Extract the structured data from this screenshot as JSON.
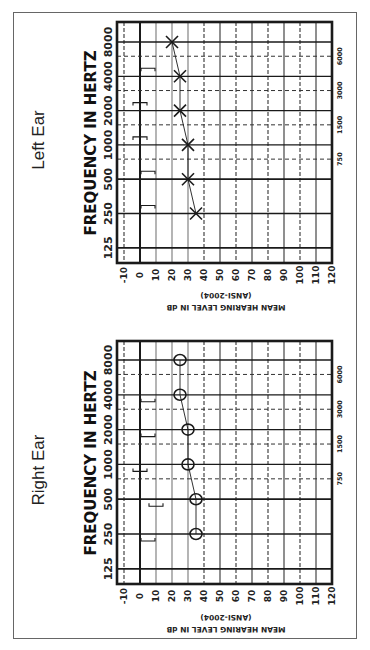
{
  "colors": {
    "ink": "#1a1a1a",
    "grid": "#333333",
    "grid_light": "#777777",
    "frame": "#666666"
  },
  "axis": {
    "frequency_title": "FREQUENCY IN HERTZ",
    "frequency_ticks": [
      "125",
      "250",
      "500",
      "1000",
      "2000",
      "4000",
      "8000"
    ],
    "interoctave_ticks": [
      "750",
      "1500",
      "3000",
      "6000"
    ],
    "db_ticks": [
      "-10",
      "0",
      "10",
      "20",
      "30",
      "40",
      "50",
      "60",
      "70",
      "80",
      "90",
      "100",
      "110",
      "120"
    ],
    "db_title": "MEAN HEARING LEVEL IN dB",
    "db_subtitle": "(ANSI-2004)"
  },
  "panels": [
    {
      "title": "Left Ear",
      "symbol": "X",
      "air_conduction_label": "Left ear air conduction (X)",
      "bone_conduction_shape": "bracket-open-down"
    },
    {
      "title": "Right Ear",
      "symbol": "O",
      "air_conduction_label": "Right ear air conduction (O)",
      "bone_conduction_shape": "bracket-open-up"
    }
  ],
  "chart_data": [
    {
      "type": "line",
      "title": "Left Ear",
      "xlabel": "FREQUENCY IN HERTZ",
      "ylabel": "MEAN HEARING LEVEL IN dB (ANSI-2004)",
      "x": [
        250,
        500,
        1000,
        2000,
        4000,
        8000
      ],
      "x_ticks": [
        125,
        250,
        500,
        1000,
        2000,
        4000,
        8000
      ],
      "x_minor_ticks": [
        750,
        1500,
        3000,
        6000
      ],
      "ylim": [
        -10,
        120
      ],
      "y_inverted": true,
      "grid": true,
      "orientation": "rotated-90",
      "series": [
        {
          "name": "Air conduction (X)",
          "marker": "x",
          "values": [
            35,
            30,
            30,
            25,
            25,
            20
          ]
        },
        {
          "name": "Bone conduction",
          "marker": "bracket",
          "points": [
            {
              "freq": 250,
              "db": 5
            },
            {
              "freq": 500,
              "db": 5
            },
            {
              "freq": 1000,
              "db": 0
            },
            {
              "freq": 2000,
              "db": 0
            },
            {
              "freq": 4000,
              "db": 5
            }
          ]
        }
      ]
    },
    {
      "type": "line",
      "title": "Right Ear",
      "xlabel": "FREQUENCY IN HERTZ",
      "ylabel": "MEAN HEARING LEVEL IN dB (ANSI-2004)",
      "x": [
        250,
        500,
        1000,
        2000,
        4000,
        8000
      ],
      "x_ticks": [
        125,
        250,
        500,
        1000,
        2000,
        4000,
        8000
      ],
      "x_minor_ticks": [
        750,
        1500,
        3000,
        6000
      ],
      "ylim": [
        -10,
        120
      ],
      "y_inverted": true,
      "grid": true,
      "orientation": "rotated-90",
      "series": [
        {
          "name": "Air conduction (O)",
          "marker": "o",
          "values": [
            35,
            35,
            30,
            30,
            25,
            25
          ]
        },
        {
          "name": "Bone conduction",
          "marker": "bracket",
          "points": [
            {
              "freq": 250,
              "db": 5
            },
            {
              "freq": 500,
              "db": 10
            },
            {
              "freq": 1000,
              "db": 0
            },
            {
              "freq": 2000,
              "db": 5
            },
            {
              "freq": 4000,
              "db": 5
            }
          ]
        }
      ]
    }
  ]
}
